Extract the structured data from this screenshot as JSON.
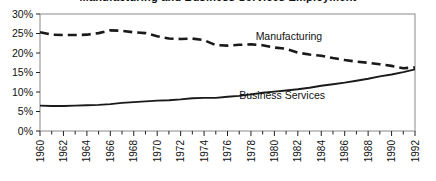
{
  "chart_data": {
    "type": "line",
    "title": "Manufacturing and Business Services Employment",
    "title_visible": false,
    "xlabel": "",
    "ylabel": "",
    "ylim": [
      0,
      30
    ],
    "yticks": [
      "0%",
      "5%",
      "10%",
      "15%",
      "20%",
      "25%",
      "30%"
    ],
    "ytick_values": [
      0,
      5,
      10,
      15,
      20,
      25,
      30
    ],
    "xlim": [
      1960,
      1992
    ],
    "xticks": [
      "1960",
      "1962",
      "1964",
      "1966",
      "1968",
      "1970",
      "1972",
      "1974",
      "1976",
      "1978",
      "1980",
      "1982",
      "1984",
      "1986",
      "1988",
      "1990",
      "1992"
    ],
    "xtick_values": [
      1960,
      1962,
      1964,
      1966,
      1968,
      1970,
      1972,
      1974,
      1976,
      1978,
      1980,
      1982,
      1984,
      1986,
      1988,
      1990,
      1992
    ],
    "minor_ticks_every": 1,
    "grid": false,
    "legend_position": "inline-annotation",
    "x": [
      1960,
      1961,
      1962,
      1963,
      1964,
      1965,
      1966,
      1967,
      1968,
      1969,
      1970,
      1971,
      1972,
      1973,
      1974,
      1975,
      1976,
      1977,
      1978,
      1979,
      1980,
      1981,
      1982,
      1983,
      1984,
      1985,
      1986,
      1987,
      1988,
      1989,
      1990,
      1991,
      1992
    ],
    "series": [
      {
        "name": "Manufacturing",
        "style": "dashed",
        "color": "#1a1a1a",
        "label_x": 1978.4,
        "label_y": 23.4,
        "values": [
          25.3,
          24.7,
          24.6,
          24.6,
          24.7,
          25.1,
          25.8,
          25.7,
          25.3,
          25.1,
          24.3,
          23.7,
          23.6,
          23.7,
          23.3,
          22.0,
          21.9,
          22.1,
          22.2,
          22.0,
          21.4,
          21.1,
          20.1,
          19.6,
          19.3,
          18.7,
          18.2,
          17.8,
          17.5,
          17.1,
          16.7,
          16.1,
          16.3
        ]
      },
      {
        "name": "Business Services",
        "style": "solid",
        "color": "#1a1a1a",
        "label_x": 1977.0,
        "label_y": 8.1,
        "values": [
          6.5,
          6.4,
          6.4,
          6.5,
          6.6,
          6.7,
          6.9,
          7.2,
          7.4,
          7.6,
          7.8,
          7.9,
          8.1,
          8.4,
          8.5,
          8.5,
          8.8,
          9.0,
          9.4,
          9.8,
          10.1,
          10.4,
          10.7,
          11.1,
          11.6,
          12.0,
          12.4,
          12.9,
          13.4,
          14.0,
          14.5,
          15.1,
          15.8
        ]
      }
    ]
  }
}
